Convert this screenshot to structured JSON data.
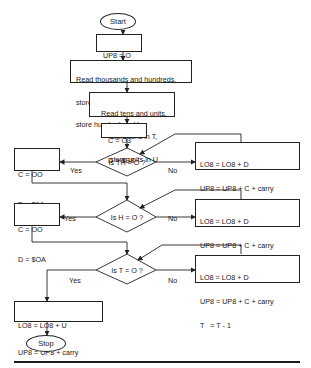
{
  "flowchart": {
    "start": "Start",
    "init": [
      "UP8 = O",
      "LO8 = O"
    ],
    "read_th": [
      "Read thousands and hundreds,",
      "store thousands in TH,",
      "store hundreds in H"
    ],
    "read_tu": [
      "Read tens and units,",
      "store tens in T,",
      "store units in U"
    ],
    "set_c03": [
      "C = O3",
      "D = $E8"
    ],
    "decision_th": "Is TH = O ?",
    "loop_th": [
      "LO8 = LO8 + D",
      "UP8 = UP8 + C + carry",
      "TH  = TH - 1"
    ],
    "set_c00_64": [
      "C = OO",
      "D = $64"
    ],
    "decision_h": "Is H = O ?",
    "loop_h": [
      "LO8 = LO8 + D",
      "UP8 = UP8 + C + carry",
      "H   = H - 1"
    ],
    "set_c00_0a": [
      "C = OO",
      "D = $OA"
    ],
    "decision_t": "Is T = O ?",
    "loop_t": [
      "LO8 = LO8 + D",
      "UP8 = UP8 + C + carry",
      "T   = T - 1"
    ],
    "final": [
      "LO8 = LO8 + U",
      "UP8 = UP8 + carry"
    ],
    "stop": "Stop",
    "yes_label": "Yes",
    "no_label": "No"
  }
}
